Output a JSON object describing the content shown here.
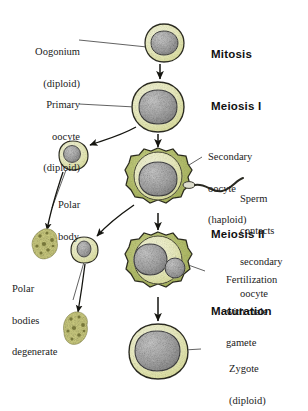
{
  "diagram": {
    "background": "#ffffff",
    "colors": {
      "cytoplasm": "#eff0c8",
      "cytoplasm_dark": "#dfe2a4",
      "zona": "#b9c46a",
      "nucleus": "#a9a9a9",
      "nucleus_light": "#c6c6c6",
      "outline": "#2b2b20",
      "degenerate": "#d7d58a",
      "text": "#1b1b1b"
    }
  },
  "left_labels": [
    {
      "id": "oogonium",
      "line1": "Oogonium",
      "line2": "(diploid)"
    },
    {
      "id": "primary-oocyte",
      "line1": "Primary",
      "line2": "oocyte",
      "line3": "(diploid)"
    },
    {
      "id": "polar-body",
      "line1": "Polar",
      "line2": "body"
    },
    {
      "id": "polar-bodies-degenerate",
      "line1": "Polar",
      "line2": "bodies",
      "line3": "degenerate"
    }
  ],
  "right_labels": [
    {
      "id": "secondary-oocyte",
      "line1": "Secondary",
      "line2": "oocyte",
      "line3": "(haploid)"
    },
    {
      "id": "sperm-contacts",
      "line1": "Sperm",
      "line2": "contacts",
      "line3": "secondary",
      "line4": "oocyte"
    },
    {
      "id": "fertilization",
      "line1": "Fertilization",
      "line2": "with male",
      "line3": "gamete"
    },
    {
      "id": "zygote",
      "line1": "Zygote",
      "line2": "(diploid)"
    }
  ],
  "stage_labels": [
    {
      "id": "mitosis",
      "text": "Mitosis"
    },
    {
      "id": "meiosis-i",
      "text": "Meiosis I"
    },
    {
      "id": "meiosis-ii",
      "text": "Meiosis II"
    },
    {
      "id": "maturation",
      "text": "Maturation"
    }
  ],
  "cells": [
    {
      "id": "oogonium-cell",
      "stage": "Oogonium (diploid)",
      "cx": 164,
      "cy": 43,
      "r": 19
    },
    {
      "id": "primary-oocyte-cell",
      "stage": "Primary oocyte (diploid)",
      "cx": 158,
      "cy": 107,
      "r": 25
    },
    {
      "id": "secondary-oocyte-cell",
      "stage": "Secondary oocyte (haploid)",
      "cx": 158,
      "cy": 180,
      "r": 31
    },
    {
      "id": "fertilized-oocyte-cell",
      "stage": "Fertilization with male gamete",
      "cx": 158,
      "cy": 264,
      "r": 31
    },
    {
      "id": "zygote-cell",
      "stage": "Zygote (diploid)",
      "cx": 158,
      "cy": 352,
      "r": 28
    },
    {
      "id": "first-polar-body",
      "stage": "Polar body",
      "cx": 73,
      "cy": 155,
      "r": 14
    },
    {
      "id": "second-polar-body",
      "stage": "Polar body",
      "cx": 84,
      "cy": 249,
      "r": 12
    },
    {
      "id": "degenerate-body-upper",
      "stage": "Polar body degenerating",
      "cx": 45,
      "cy": 248
    },
    {
      "id": "degenerate-body-lower",
      "stage": "Polar body degenerating",
      "cx": 76,
      "cy": 330
    }
  ],
  "sperm": {
    "id": "sperm",
    "label": "sperm contacting secondary oocyte"
  }
}
